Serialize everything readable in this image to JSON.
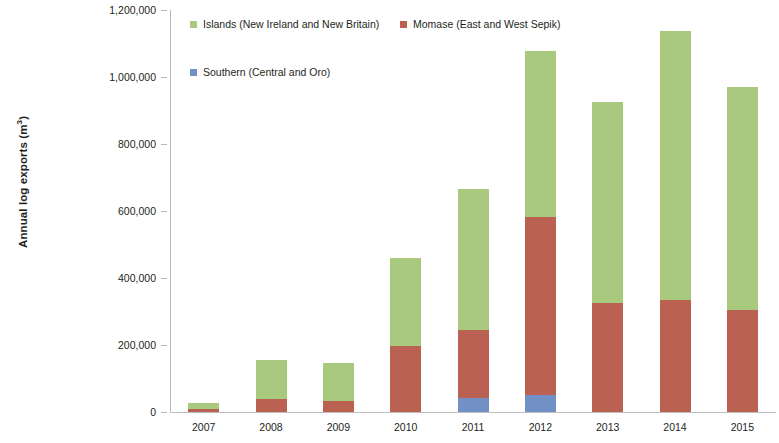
{
  "chart_data": {
    "type": "bar",
    "stacked": true,
    "title": "",
    "subtitle": "",
    "xlabel": "",
    "ylabel": "Annual log exports (m³)",
    "ylabel_base": "Annual log exports (m",
    "ylabel_sup": "3",
    "ylabel_tail": ")",
    "categories": [
      "2007",
      "2008",
      "2009",
      "2010",
      "2011",
      "2012",
      "2013",
      "2014",
      "2015"
    ],
    "series": [
      {
        "name": "Southern (Central and Oro)",
        "color": "#7190c6",
        "values": [
          0,
          0,
          0,
          0,
          42000,
          51000,
          0,
          0,
          0
        ]
      },
      {
        "name": "Momase (East and West Sepik)",
        "color": "#bb6152",
        "values": [
          10000,
          39000,
          33000,
          197000,
          203000,
          531000,
          325000,
          334000,
          304000
        ]
      },
      {
        "name": "Islands (New Ireland and New Britain)",
        "color": "#a9ca7e",
        "values": [
          17000,
          116000,
          113000,
          263000,
          421000,
          495000,
          600000,
          803000,
          666000
        ]
      }
    ],
    "totals": [
      27000,
      155000,
      146000,
      460000,
      666000,
      1077000,
      925000,
      1137000,
      970000
    ],
    "ylim": [
      0,
      1200000
    ],
    "ytick_values": [
      0,
      200000,
      400000,
      600000,
      800000,
      1000000,
      1200000
    ],
    "ytick_labels": [
      "0",
      "200,000",
      "400,000",
      "600,000",
      "800,000",
      "1,000,000",
      "1,200,000"
    ],
    "grid": false,
    "legend_position": "top-inside-left"
  },
  "legend": {
    "islands": {
      "label": "Islands (New Ireland and New Britain)",
      "color": "#a9ca7e"
    },
    "momase": {
      "label": "Momase (East and West Sepik)",
      "color": "#bb6152"
    },
    "southern": {
      "label": "Southern (Central and Oro)",
      "color": "#7190c6"
    }
  }
}
